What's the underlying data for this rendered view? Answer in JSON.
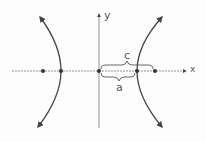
{
  "diagram": {
    "axes": {
      "x_label": "x",
      "y_label": "y"
    },
    "labels": {
      "c": "c",
      "a": "a"
    },
    "points": [
      {
        "name": "left-focus",
        "x": 43,
        "y": 71
      },
      {
        "name": "left-vertex",
        "x": 61,
        "y": 71
      },
      {
        "name": "origin",
        "x": 99,
        "y": 71
      },
      {
        "name": "right-vertex",
        "x": 137,
        "y": 71
      },
      {
        "name": "right-focus",
        "x": 155,
        "y": 71
      }
    ],
    "stroke_color": "#444444"
  }
}
